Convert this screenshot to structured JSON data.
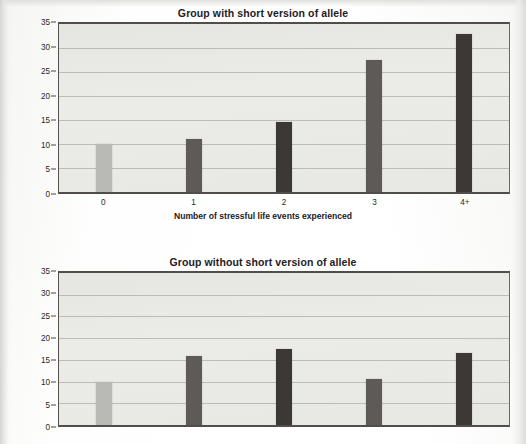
{
  "figure": {
    "ylabel": "Major depression episode (%)",
    "xlabel": "Number of stressful life events experienced",
    "colors": {
      "bar_light": "#b9b9b6",
      "bar_medium": "#5d5a57",
      "bar_dark": "#3b3835",
      "plot_background": "#e8e8e5",
      "axis": "#514d49",
      "gridline": "#969692"
    }
  },
  "chart_data": [
    {
      "type": "bar",
      "title": "Group with short version of allele",
      "xlabel": "Number of stressful life events experienced",
      "ylabel": "Major depression episode (%)",
      "categories": [
        "0",
        "1",
        "2",
        "3",
        "4+"
      ],
      "values": [
        10,
        11,
        14.5,
        27.5,
        33
      ],
      "bar_colors": [
        "#b9b9b6",
        "#5d5a57",
        "#3b3835",
        "#5d5a57",
        "#3b3835"
      ],
      "ylim": [
        0,
        35
      ],
      "yticks": [
        0,
        5,
        10,
        15,
        20,
        25,
        30,
        35
      ],
      "grid": true,
      "legend": "none"
    },
    {
      "type": "bar",
      "title": "Group without short version of allele",
      "xlabel": "",
      "ylabel": "Major depression episode (%)",
      "categories": [
        "0",
        "1",
        "2",
        "3",
        "4+"
      ],
      "values": [
        10,
        16,
        17.5,
        10.5,
        16.5
      ],
      "bar_colors": [
        "#b9b9b6",
        "#5d5a57",
        "#3b3835",
        "#5d5a57",
        "#3b3835"
      ],
      "ylim": [
        0,
        35
      ],
      "yticks": [
        0,
        5,
        10,
        15,
        20,
        25,
        30,
        35
      ],
      "grid": true,
      "legend": "none",
      "note": "bottom chart is cropped at the image edge; x tick labels not visible"
    }
  ],
  "charts": [
    {
      "title": "Group with short version of allele",
      "ylabel": "Major depression episode (%)",
      "xlabel": "Number of stressful life events experienced",
      "yticks": [
        "35",
        "30",
        "25",
        "20",
        "15",
        "10",
        "5",
        "0"
      ],
      "xticks": [
        "0",
        "1",
        "2",
        "3",
        "4+"
      ],
      "bars": [
        {
          "category": "0",
          "value": 10,
          "color": "#b9b9b6"
        },
        {
          "category": "1",
          "value": 11,
          "color": "#5d5a57"
        },
        {
          "category": "2",
          "value": 14.5,
          "color": "#3b3835"
        },
        {
          "category": "3",
          "value": 27.5,
          "color": "#5d5a57"
        },
        {
          "category": "4+",
          "value": 33,
          "color": "#3b3835"
        }
      ]
    },
    {
      "title": "Group without short version of allele",
      "ylabel": "Major depression episode (%)",
      "xlabel": "",
      "yticks": [
        "35",
        "30",
        "25",
        "20",
        "15",
        "10",
        "5",
        "0"
      ],
      "xticks": [],
      "bars": [
        {
          "category": "0",
          "value": 10,
          "color": "#b9b9b6"
        },
        {
          "category": "1",
          "value": 16,
          "color": "#5d5a57"
        },
        {
          "category": "2",
          "value": 17.5,
          "color": "#3b3835"
        },
        {
          "category": "3",
          "value": 10.5,
          "color": "#5d5a57"
        },
        {
          "category": "4+",
          "value": 16.5,
          "color": "#3b3835"
        }
      ]
    }
  ]
}
